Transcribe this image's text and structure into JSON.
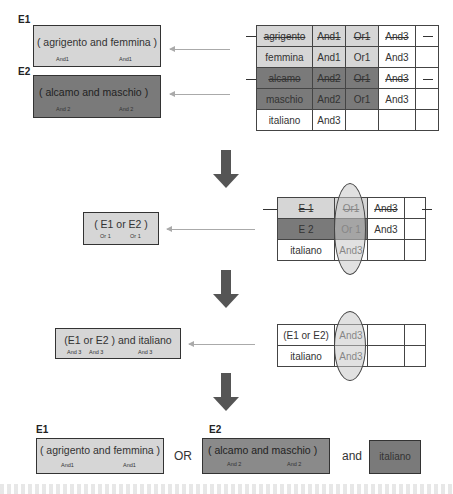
{
  "step1": {
    "e1": {
      "label": "E1",
      "text": "( agrigento and femmina )",
      "subs": [
        "And1",
        "And1"
      ]
    },
    "e2": {
      "label": "E2",
      "text": "( alcamo and maschio )",
      "subs": [
        "And 2",
        "And 2"
      ]
    },
    "table": {
      "rows": [
        {
          "cells": [
            "agrigento",
            "And1",
            "Or1",
            "And3",
            ""
          ],
          "shade": "light",
          "struck": true
        },
        {
          "cells": [
            "femmina",
            "And1",
            "Or1",
            "And3",
            ""
          ],
          "shade": "light",
          "struck": false
        },
        {
          "cells": [
            "alcamo",
            "And2",
            "Or1",
            "And3",
            ""
          ],
          "shade": "dark",
          "struck": true
        },
        {
          "cells": [
            "maschio",
            "And2",
            "Or1",
            "And3",
            ""
          ],
          "shade": "dark",
          "struck": false
        },
        {
          "cells": [
            "italiano",
            "And3",
            "",
            "",
            ""
          ],
          "shade": "none",
          "struck": false
        }
      ]
    }
  },
  "step2": {
    "box": {
      "text": "( E1 or E2 )",
      "subs": [
        "Or 1",
        "Or 1"
      ]
    },
    "table": {
      "rows": [
        {
          "cells": [
            "E 1",
            "Or1",
            "And3",
            ""
          ],
          "shade": "light",
          "struck": true
        },
        {
          "cells": [
            "E 2",
            "Or 1",
            "And3",
            ""
          ],
          "shade": "dark",
          "struck": false
        },
        {
          "cells": [
            "italiano",
            "And3",
            "",
            ""
          ],
          "shade": "none",
          "struck": false
        }
      ]
    }
  },
  "step3": {
    "box": {
      "text": "(E1 or E2 ) and italiano",
      "subs": [
        "And 3",
        "And 3",
        "And 3"
      ]
    },
    "table": {
      "rows": [
        {
          "cells": [
            "(E1 or E2)",
            "And3",
            "",
            ""
          ]
        },
        {
          "cells": [
            "italiano",
            "And3",
            "",
            ""
          ]
        }
      ]
    }
  },
  "result": {
    "e1": {
      "label": "E1",
      "text": "( agrigento and femmina )",
      "subs": [
        "And1",
        "And1"
      ]
    },
    "or_label": "OR",
    "e2": {
      "label": "E2",
      "text": "( alcamo and maschio )",
      "subs": [
        "And 2",
        "And 2"
      ]
    },
    "and_label": "and",
    "italiano": "italiano"
  },
  "colors": {
    "light": "#d6d6d6",
    "dark": "#7a7a7a",
    "arrow": "#555555",
    "border": "#333333"
  }
}
